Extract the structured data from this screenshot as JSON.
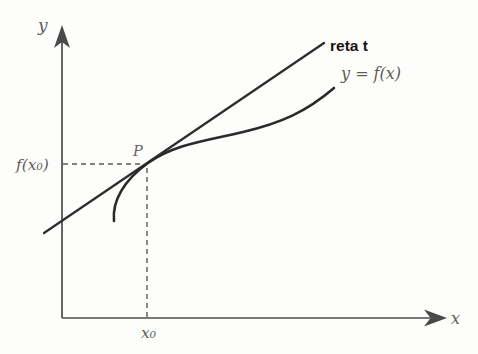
{
  "figure": {
    "background_color": "#fdfdfb",
    "axes": {
      "y_label": "y",
      "x_label": "x",
      "color": "#4a4a4a",
      "label_color": "#5e5e5e"
    },
    "tangent_line": {
      "label": "reta t",
      "stroke_color": "#2e2e2e",
      "label_color": "#161616"
    },
    "curve": {
      "label": "y = f(x)",
      "stroke_color": "#2a2a2a",
      "label_color": "#5d5d5d"
    },
    "point": {
      "label": "P",
      "label_color": "#636363"
    },
    "guides": {
      "y_value_label": "f(x₀)",
      "x_value_label": "x₀",
      "dash_color": "#4c4c4c",
      "label_color": "#5d5d5d"
    }
  }
}
